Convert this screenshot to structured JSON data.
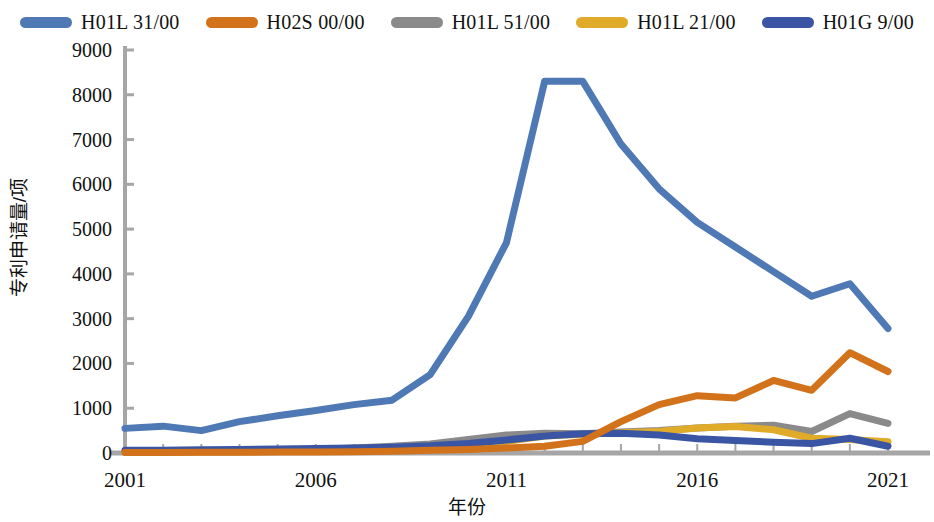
{
  "chart_data": {
    "type": "line",
    "title": "",
    "xlabel": "年份",
    "ylabel": "专利申请量/项",
    "xlim": [
      2001,
      2021
    ],
    "ylim": [
      0,
      9000
    ],
    "ytick_step": 1000,
    "grid": false,
    "legend_position": "top",
    "x": [
      2001,
      2002,
      2003,
      2004,
      2005,
      2006,
      2007,
      2008,
      2009,
      2010,
      2011,
      2012,
      2013,
      2014,
      2015,
      2016,
      2017,
      2018,
      2019,
      2020,
      2021
    ],
    "xticks": [
      "2001",
      "2006",
      "2011",
      "2016",
      "2021"
    ],
    "yticks": [
      "0",
      "1000",
      "2000",
      "3000",
      "4000",
      "5000",
      "6000",
      "7000",
      "8000",
      "9000"
    ],
    "series": [
      {
        "name": "H01L 31/00",
        "color": "#4e79b5",
        "values": [
          550,
          600,
          500,
          700,
          830,
          950,
          1080,
          1180,
          1750,
          3050,
          4700,
          8300,
          8300,
          6900,
          5900,
          5150,
          4600,
          4050,
          3500,
          3780,
          2780
        ]
      },
      {
        "name": "H02S 00/00",
        "color": "#d2721a",
        "values": [
          10,
          10,
          15,
          15,
          20,
          25,
          30,
          40,
          60,
          80,
          110,
          150,
          260,
          700,
          1080,
          1280,
          1230,
          1620,
          1400,
          2240,
          1820
        ]
      },
      {
        "name": "H01L 51/00",
        "color": "#8a8a8a",
        "values": [
          30,
          35,
          40,
          50,
          60,
          80,
          110,
          150,
          200,
          300,
          400,
          440,
          430,
          470,
          500,
          560,
          600,
          620,
          480,
          880,
          660
        ]
      },
      {
        "name": "H01L 21/00",
        "color": "#e0ab28",
        "values": [
          20,
          25,
          25,
          30,
          40,
          50,
          65,
          80,
          110,
          170,
          260,
          380,
          420,
          450,
          480,
          560,
          590,
          520,
          330,
          300,
          250
        ]
      },
      {
        "name": "H01G 9/00",
        "color": "#3a55a4",
        "values": [
          60,
          60,
          70,
          80,
          90,
          100,
          110,
          130,
          160,
          210,
          290,
          380,
          430,
          440,
          400,
          320,
          280,
          240,
          210,
          330,
          150
        ]
      }
    ]
  },
  "legend": {
    "items": [
      {
        "label": "H01L 31/00",
        "color": "#4e79b5"
      },
      {
        "label": "H02S 00/00",
        "color": "#d2721a"
      },
      {
        "label": "H01L 51/00",
        "color": "#8a8a8a"
      },
      {
        "label": "H01L 21/00",
        "color": "#e0ab28"
      },
      {
        "label": "H01G 9/00",
        "color": "#3a55a4"
      }
    ]
  },
  "axes": {
    "y_title": "专利申请量/项",
    "x_title": "年份",
    "axis_color": "#a6a6a6"
  }
}
